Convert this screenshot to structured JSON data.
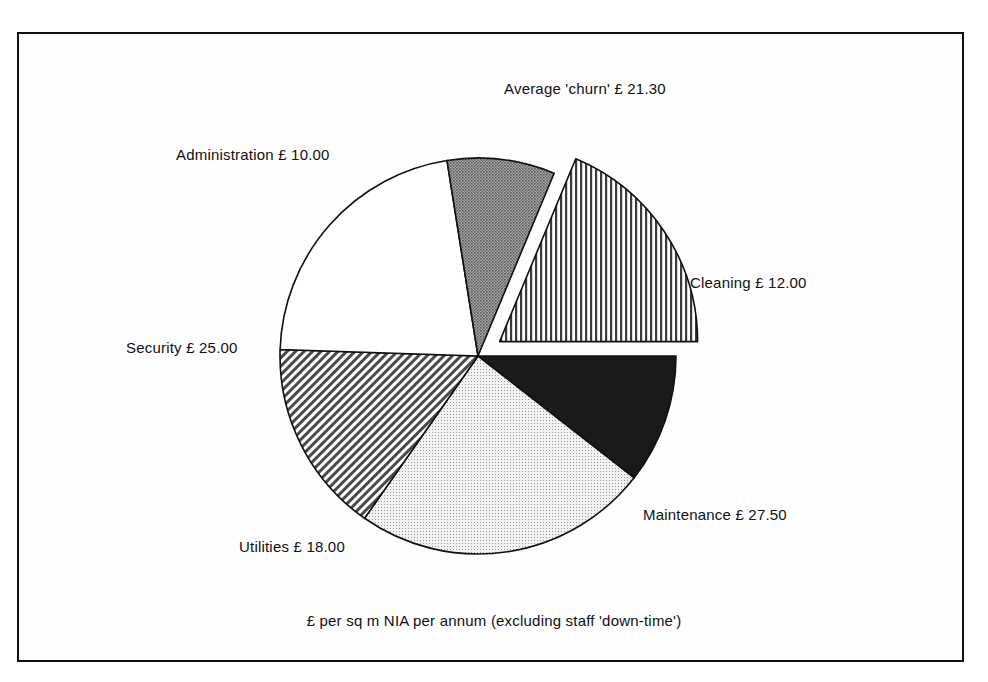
{
  "chart_data": {
    "type": "pie",
    "title": "",
    "subtitle": "",
    "caption": "£  per sq m NIA per annum (excluding staff 'down-time')",
    "currency_symbol": "£",
    "unit": "£ per sq m NIA per annum",
    "total": 113.8,
    "start_angle_deg": 0,
    "direction": "clockwise",
    "legend": "none (direct slice labels)",
    "grid": false,
    "categories": [
      "Cleaning",
      "Maintenance",
      "Utilities",
      "Security",
      "Administration",
      "Average 'churn'"
    ],
    "values": [
      12.0,
      27.5,
      18.0,
      25.0,
      10.0,
      21.3
    ],
    "slices": [
      {
        "name": "Cleaning",
        "label": "Cleaning £ 12.00",
        "value": 12.0,
        "value_text": "12.00",
        "percent": 10.5,
        "fill": "solid-black",
        "color": "#1a1a1a",
        "exploded": false
      },
      {
        "name": "Maintenance",
        "label": "Maintenance £ 27.50",
        "value": 27.5,
        "value_text": "27.50",
        "percent": 24.2,
        "fill": "light-stipple",
        "color": "#d8d8d8",
        "exploded": false
      },
      {
        "name": "Utilities",
        "label": "Utilities £ 18.00",
        "value": 18.0,
        "value_text": "18.00",
        "percent": 15.8,
        "fill": "diagonal-hatch",
        "color": "#b5b5b5",
        "exploded": false
      },
      {
        "name": "Security",
        "label": "Security £ 25.00",
        "value": 25.0,
        "value_text": "25.00",
        "percent": 22.0,
        "fill": "solid-white",
        "color": "#ffffff",
        "exploded": false
      },
      {
        "name": "Administration",
        "label": "Administration £ 10.00",
        "value": 10.0,
        "value_text": "10.00",
        "percent": 8.8,
        "fill": "dark-stipple",
        "color": "#8a8a8a",
        "exploded": false
      },
      {
        "name": "Average 'churn'",
        "label": "Average 'churn' £ 21.30",
        "value": 21.3,
        "value_text": "21.30",
        "percent": 18.7,
        "fill": "vertical-stripes",
        "color": "#c9c9c9",
        "exploded": true
      }
    ]
  },
  "labels": {
    "cleaning": "Cleaning £ 12.00",
    "maintenance": "Maintenance £ 27.50",
    "utilities": "Utilities £ 18.00",
    "security": "Security £ 25.00",
    "administration": "Administration £ 10.00",
    "churn": "Average 'churn' £ 21.30"
  },
  "caption": "£  per sq m NIA per annum (excluding staff 'down-time')",
  "colors": {
    "border": "#101010",
    "background": "#ffffff",
    "outline": "#101010"
  }
}
